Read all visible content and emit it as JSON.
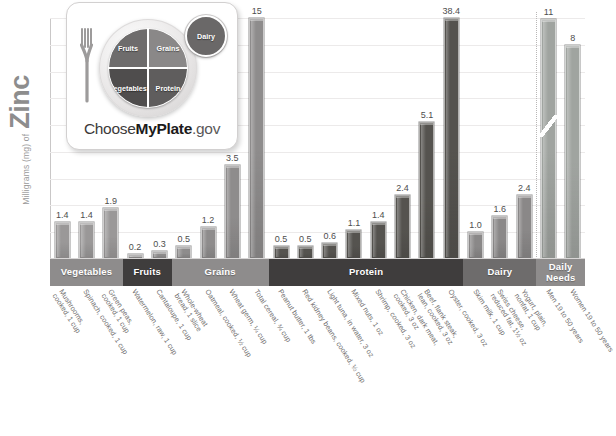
{
  "axis": {
    "y_title_small": "Milligrams (mg) of",
    "y_title_big": "Zinc"
  },
  "logo": {
    "name": "myplate-logo",
    "segments": {
      "fruits": "Fruits",
      "grains": "Grains",
      "vegetables": "Vegetables",
      "protein": "Protein",
      "dairy": "Dairy"
    },
    "wordmark_pre": "Choose",
    "wordmark_bold": "MyPlate",
    "wordmark_post": ".gov"
  },
  "categories": [
    {
      "label": "Vegetables",
      "count": 3,
      "color": "#8e8c8c"
    },
    {
      "label": "Fruits",
      "count": 2,
      "color": "#3f3d3d"
    },
    {
      "label": "Grains",
      "count": 4,
      "color": "#8e8c8c"
    },
    {
      "label": "Protein",
      "count": 8,
      "color": "#3f3d3d"
    },
    {
      "label": "Dairy",
      "count": 3,
      "color": "#6e6c6c"
    },
    {
      "label": "Daily Needs",
      "count": 2,
      "color": "#8e8c8c"
    }
  ],
  "chart_data": {
    "type": "bar",
    "xlabel": "",
    "ylabel": "Milligrams (mg) of Zinc",
    "ylim": [
      0,
      9
    ],
    "y_gridline_step": 1,
    "grid": true,
    "legend": "none",
    "axis_break": {
      "bar_index": 20,
      "displayed_value": 38.4,
      "note": "scale break on Oyster bar"
    },
    "categories": [
      "Mushrooms, cooked, 1 cup",
      "Spinach, cooked, 1 cup",
      "Green peas, cooked, 1 cup",
      "Watermelon, raw, 1 cup",
      "Cantaloupe, 1 cup",
      "Whole-wheat bread, 1 slice",
      "Oatmeal, cooked, 1/2 cup",
      "Wheat germ, 1/4 cup",
      "Total cereal, 3/4 cup",
      "Peanut butter, 1 tbs",
      "Red kidney beans, cooked, 1/2 cup",
      "Light tuna, in water, 3 oz",
      "Mixed nuts, 1 oz",
      "Shrimp, cooked, 3 oz",
      "Chicken, dark meat, cooked, 3 oz",
      "Beef, flank steak, lean, cooked, 3 oz",
      "Oyster, cooked, 3 oz",
      "Skim milk, 1 cup",
      "Swiss cheese, reduced fat, 1 1/2 oz",
      "Yogurt, plain, nonfat, 1 cup",
      "Men 19 to 50 years",
      "Women 19 to 50 years"
    ],
    "values": [
      1.4,
      1.4,
      1.9,
      0.2,
      0.3,
      0.5,
      1.2,
      3.5,
      15,
      0.5,
      0.5,
      0.6,
      1.1,
      1.4,
      2.4,
      5.1,
      38.4,
      1.0,
      1.6,
      2.4,
      11,
      8
    ],
    "labels": [
      "1.4",
      "1.4",
      "1.9",
      "0.2",
      "0.3",
      "0.5",
      "1.2",
      "3.5",
      "15",
      "0.5",
      "0.5",
      "0.6",
      "1.1",
      "1.4",
      "2.4",
      "5.1",
      "38.4",
      "1.0",
      "1.6",
      "2.4",
      "11",
      "8"
    ],
    "groups": [
      "Vegetables",
      "Vegetables",
      "Vegetables",
      "Fruits",
      "Fruits",
      "Grains",
      "Grains",
      "Grains",
      "Grains",
      "Protein",
      "Protein",
      "Protein",
      "Protein",
      "Protein",
      "Protein",
      "Protein",
      "Protein",
      "Dairy",
      "Dairy",
      "Dairy",
      "Daily Needs",
      "Daily Needs"
    ]
  },
  "ticks": [
    [
      "Mushrooms,",
      "cooked, 1 cup"
    ],
    [
      "Spinach, cooked, 1 cup"
    ],
    [
      "Green peas,",
      "cooked, 1 cup"
    ],
    [
      "Watermelon, raw, 1 cup"
    ],
    [
      "Cantaloupe, 1 cup"
    ],
    [
      "Whole-wheat",
      "bread, 1 slice"
    ],
    [
      "Oatmeal, cooked, ½ cup"
    ],
    [
      "Wheat germ, ¼ cup"
    ],
    [
      "Total cereal, ¾ cup"
    ],
    [
      "Peanut butter, 1 tbs"
    ],
    [
      "Red kidney beans, cooked, ½ cup"
    ],
    [
      "Light tuna, in water, 3 oz"
    ],
    [
      "Mixed nuts, 1 oz"
    ],
    [
      "Shrimp, cooked, 3 oz"
    ],
    [
      "Chicken, dark meat,",
      "cooked, 3 oz"
    ],
    [
      "Beef, flank steak,",
      "lean, cooked, 3 oz"
    ],
    [
      "Oyster, cooked, 3 oz"
    ],
    [
      "Skim milk, 1 cup"
    ],
    [
      "Swiss cheese,",
      "reduced fat, 1½ oz"
    ],
    [
      "Yogurt, plain,",
      "nonfat, 1 cup"
    ],
    [
      "Men 19 to 50 years"
    ],
    [
      "Women 19 to 50 years"
    ]
  ],
  "bar_colors": {
    "vegetables": "#9a9898",
    "fruits": "#8e8c8c",
    "grains": "#8e8c8c",
    "protein": "#55534f",
    "dairy": "#8a8888",
    "daily": "#a0a4a0"
  }
}
